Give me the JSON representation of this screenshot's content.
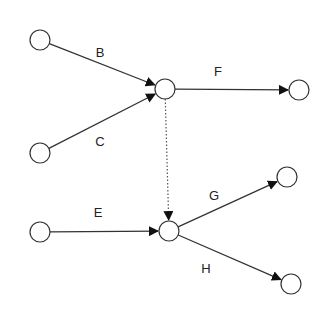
{
  "diagram": {
    "type": "activity-on-arrow network",
    "nodes": [
      {
        "id": "n1",
        "x": 40,
        "y": 40
      },
      {
        "id": "n2",
        "x": 40,
        "y": 153
      },
      {
        "id": "n3",
        "x": 165,
        "y": 89
      },
      {
        "id": "n4",
        "x": 299,
        "y": 90
      },
      {
        "id": "n5",
        "x": 40,
        "y": 232
      },
      {
        "id": "n6",
        "x": 169,
        "y": 231
      },
      {
        "id": "n7",
        "x": 287,
        "y": 177
      },
      {
        "id": "n8",
        "x": 291,
        "y": 284
      }
    ],
    "edges": [
      {
        "id": "B",
        "label": "B",
        "from": "n1",
        "to": "n3",
        "style": "solid",
        "label_x": 100,
        "label_y": 57
      },
      {
        "id": "C",
        "label": "C",
        "from": "n2",
        "to": "n3",
        "style": "solid",
        "label_x": 100,
        "label_y": 146
      },
      {
        "id": "F",
        "label": "F",
        "from": "n3",
        "to": "n4",
        "style": "solid",
        "label_x": 218,
        "label_y": 76
      },
      {
        "id": "dummy",
        "label": "",
        "from": "n3",
        "to": "n6",
        "style": "dotted"
      },
      {
        "id": "E",
        "label": "E",
        "from": "n5",
        "to": "n6",
        "style": "solid",
        "label_x": 98,
        "label_y": 217
      },
      {
        "id": "G",
        "label": "G",
        "from": "n6",
        "to": "n7",
        "style": "solid",
        "label_x": 214,
        "label_y": 200
      },
      {
        "id": "H",
        "label": "H",
        "from": "n6",
        "to": "n8",
        "style": "solid",
        "label_x": 206,
        "label_y": 273
      }
    ],
    "colors": {
      "stroke": "#333333",
      "fill": "#ffffff",
      "text": "#222222"
    }
  }
}
